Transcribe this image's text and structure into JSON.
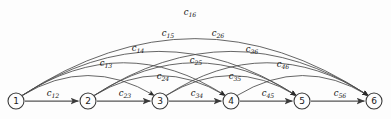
{
  "figure": {
    "title": "",
    "background_color": "#fdfdfd",
    "line_color": "#4a4a4a",
    "node_fill": "#fdfdfd",
    "node_stroke": "#3a3a3a",
    "width": 391,
    "height": 119
  },
  "nodes": [
    {
      "id": "1",
      "label": "1",
      "x": 16,
      "y": 101,
      "r": 8
    },
    {
      "id": "2",
      "label": "2",
      "x": 88,
      "y": 101,
      "r": 8
    },
    {
      "id": "3",
      "label": "3",
      "x": 160,
      "y": 101,
      "r": 8
    },
    {
      "id": "4",
      "label": "4",
      "x": 231,
      "y": 101,
      "r": 8
    },
    {
      "id": "5",
      "label": "5",
      "x": 302,
      "y": 101,
      "r": 8
    },
    {
      "id": "6",
      "label": "6",
      "x": 374,
      "y": 101,
      "r": 8
    }
  ],
  "edges": [
    {
      "id": "c12",
      "from": "1",
      "to": "2",
      "base": "c",
      "sub": "12",
      "label_x": 53,
      "label_y": 93,
      "kind": "straight",
      "lift": 0
    },
    {
      "id": "c23",
      "from": "2",
      "to": "3",
      "base": "c",
      "sub": "23",
      "label_x": 125,
      "label_y": 93,
      "kind": "straight",
      "lift": 0
    },
    {
      "id": "c34",
      "from": "3",
      "to": "4",
      "base": "c",
      "sub": "34",
      "label_x": 197,
      "label_y": 93,
      "kind": "straight",
      "lift": 0
    },
    {
      "id": "c45",
      "from": "4",
      "to": "5",
      "base": "c",
      "sub": "45",
      "label_x": 268,
      "label_y": 93,
      "kind": "straight",
      "lift": 0
    },
    {
      "id": "c56",
      "from": "5",
      "to": "6",
      "base": "c",
      "sub": "56",
      "label_x": 340,
      "label_y": 93,
      "kind": "straight",
      "lift": 0
    },
    {
      "id": "c13",
      "from": "1",
      "to": "3",
      "base": "c",
      "sub": "13",
      "label_x": 106,
      "label_y": 63,
      "kind": "arc",
      "lift": 32
    },
    {
      "id": "c24",
      "from": "2",
      "to": "4",
      "base": "c",
      "sub": "24",
      "label_x": 163,
      "label_y": 76,
      "kind": "arc",
      "lift": 32
    },
    {
      "id": "c35",
      "from": "3",
      "to": "5",
      "base": "c",
      "sub": "35",
      "label_x": 235,
      "label_y": 76,
      "kind": "arc",
      "lift": 32
    },
    {
      "id": "c46",
      "from": "4",
      "to": "6",
      "base": "c",
      "sub": "46",
      "label_x": 283,
      "label_y": 64,
      "kind": "arc",
      "lift": 32
    },
    {
      "id": "c14",
      "from": "1",
      "to": "4",
      "base": "c",
      "sub": "14",
      "label_x": 138,
      "label_y": 48,
      "kind": "arc",
      "lift": 50
    },
    {
      "id": "c25",
      "from": "2",
      "to": "5",
      "base": "c",
      "sub": "25",
      "label_x": 196,
      "label_y": 60,
      "kind": "arc",
      "lift": 50
    },
    {
      "id": "c36",
      "from": "3",
      "to": "6",
      "base": "c",
      "sub": "36",
      "label_x": 252,
      "label_y": 49,
      "kind": "arc",
      "lift": 50
    },
    {
      "id": "c15",
      "from": "1",
      "to": "5",
      "base": "c",
      "sub": "15",
      "label_x": 168,
      "label_y": 33,
      "kind": "arc",
      "lift": 66
    },
    {
      "id": "c26",
      "from": "2",
      "to": "6",
      "base": "c",
      "sub": "26",
      "label_x": 218,
      "label_y": 33,
      "kind": "arc",
      "lift": 66
    },
    {
      "id": "c16",
      "from": "1",
      "to": "6",
      "base": "c",
      "sub": "16",
      "label_x": 190,
      "label_y": 12,
      "kind": "arc",
      "lift": 84
    }
  ]
}
